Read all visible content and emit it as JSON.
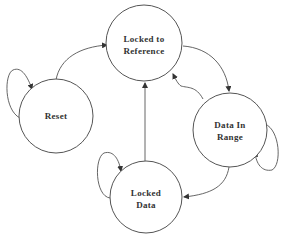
{
  "diagram": {
    "type": "state-machine",
    "nodes": [
      {
        "id": "locked_ref",
        "lines": [
          "Locked to",
          "Reference"
        ],
        "cx": 144,
        "cy": 43,
        "r": 38
      },
      {
        "id": "reset",
        "lines": [
          "Reset"
        ],
        "cx": 56,
        "cy": 116,
        "r": 37
      },
      {
        "id": "data_in_range",
        "lines": [
          "Data In",
          "Range"
        ],
        "cx": 230,
        "cy": 130,
        "r": 37
      },
      {
        "id": "locked_data",
        "lines": [
          "Locked",
          "Data"
        ],
        "cx": 146,
        "cy": 197,
        "r": 36
      }
    ],
    "edges": [
      {
        "from": "reset",
        "to": "reset",
        "kind": "self-loop"
      },
      {
        "from": "reset",
        "to": "locked_ref"
      },
      {
        "from": "locked_ref",
        "to": "data_in_range"
      },
      {
        "from": "data_in_range",
        "to": "locked_ref"
      },
      {
        "from": "data_in_range",
        "to": "data_in_range",
        "kind": "self-loop"
      },
      {
        "from": "data_in_range",
        "to": "locked_data"
      },
      {
        "from": "locked_data",
        "to": "locked_data",
        "kind": "self-loop"
      },
      {
        "from": "locked_data",
        "to": "locked_ref"
      }
    ],
    "colors": {
      "stroke": "#555555",
      "text": "#333333",
      "background": "#ffffff"
    }
  },
  "labels": {
    "locked_ref_line1": "Locked to",
    "locked_ref_line2": "Reference",
    "reset": "Reset",
    "data_in_range_line1": "Data In",
    "data_in_range_line2": "Range",
    "locked_data_line1": "Locked",
    "locked_data_line2": "Data"
  }
}
